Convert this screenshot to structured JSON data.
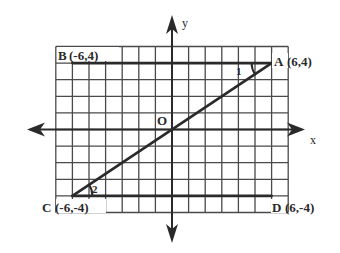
{
  "diagram": {
    "type": "coordinate-grid",
    "grid": {
      "x_range": [
        -7,
        7
      ],
      "y_range": [
        -5,
        5
      ],
      "unit": 1
    },
    "axes": {
      "x_label": "x",
      "y_label": "y",
      "origin_label": "O"
    },
    "points": [
      {
        "name": "A",
        "label": "A",
        "coords": "(6,4)",
        "x": 6,
        "y": 4
      },
      {
        "name": "B",
        "label": "B",
        "coords": "(-6,4)",
        "x": -6,
        "y": 4
      },
      {
        "name": "C",
        "label": "C",
        "coords": "(-6,-4)",
        "x": -6,
        "y": -4
      },
      {
        "name": "D",
        "label": "D",
        "coords": "(6,-4)",
        "x": 6,
        "y": -4
      }
    ],
    "segments": [
      {
        "name": "AB",
        "from": "A",
        "to": "B",
        "style": "bold"
      },
      {
        "name": "CD",
        "from": "C",
        "to": "D",
        "style": "bold"
      },
      {
        "name": "AC",
        "from": "C",
        "to": "A",
        "style": "bold",
        "passes_through": "O"
      }
    ],
    "angles": [
      {
        "label": "1",
        "vertex": "A",
        "between": [
          "AB",
          "AC"
        ]
      },
      {
        "label": "2",
        "vertex": "C",
        "between": [
          "CD",
          "CA"
        ]
      }
    ]
  },
  "colors": {
    "ink": "#2a2a2a",
    "grid": "#4a4a4a",
    "background": "#ffffff"
  }
}
